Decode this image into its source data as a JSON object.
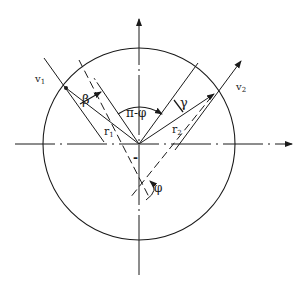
{
  "diagram": {
    "type": "geometric-velocity-diagram",
    "labels": {
      "v1": "v",
      "v1_sub": "1",
      "v2": "v",
      "v2_sub": "2",
      "r1": "r",
      "r1_sub": "1",
      "r2": "r",
      "r2_sub": "2",
      "beta": "β",
      "gamma": "γ",
      "pi_minus_phi": "π-φ",
      "phi": "φ",
      "minus": "-"
    },
    "colors": {
      "stroke": "#1a1a1a",
      "background": "#ffffff"
    }
  }
}
